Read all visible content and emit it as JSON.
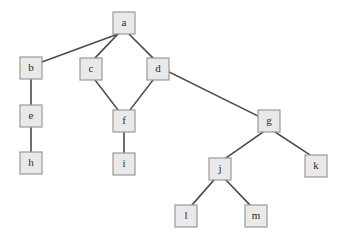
{
  "diagram": {
    "background_color": "#ffffff",
    "node_fill_color": "#e9e9e9",
    "node_border_color": "#9a9a9a",
    "edge_color": "#4a4a4a",
    "label_color": "#2b2b2b",
    "node_width": 22,
    "node_height": 22,
    "nodes": [
      {
        "id": "a",
        "label": "a",
        "x": 113,
        "y": 12
      },
      {
        "id": "b",
        "label": "b",
        "x": 20,
        "y": 57
      },
      {
        "id": "c",
        "label": "c",
        "x": 80,
        "y": 58
      },
      {
        "id": "d",
        "label": "d",
        "x": 147,
        "y": 58
      },
      {
        "id": "e",
        "label": "e",
        "x": 20,
        "y": 105
      },
      {
        "id": "f",
        "label": "f",
        "x": 113,
        "y": 110
      },
      {
        "id": "g",
        "label": "g",
        "x": 258,
        "y": 110
      },
      {
        "id": "h",
        "label": "h",
        "x": 20,
        "y": 152
      },
      {
        "id": "i",
        "label": "i",
        "x": 113,
        "y": 153
      },
      {
        "id": "j",
        "label": "j",
        "x": 209,
        "y": 158
      },
      {
        "id": "k",
        "label": "k",
        "x": 305,
        "y": 155
      },
      {
        "id": "l",
        "label": "l",
        "x": 175,
        "y": 205
      },
      {
        "id": "m",
        "label": "m",
        "x": 245,
        "y": 205
      }
    ],
    "edges": [
      {
        "from": "a",
        "to": "b",
        "x1": 118,
        "y1": 34,
        "x2": 42,
        "y2": 62
      },
      {
        "from": "a",
        "to": "c",
        "x1": 118,
        "y1": 34,
        "x2": 95,
        "y2": 58
      },
      {
        "from": "a",
        "to": "d",
        "x1": 129,
        "y1": 34,
        "x2": 153,
        "y2": 58
      },
      {
        "from": "b",
        "to": "e",
        "x1": 31,
        "y1": 79,
        "x2": 31,
        "y2": 105
      },
      {
        "from": "e",
        "to": "h",
        "x1": 31,
        "y1": 127,
        "x2": 31,
        "y2": 152
      },
      {
        "from": "c",
        "to": "f",
        "x1": 95,
        "y1": 80,
        "x2": 118,
        "y2": 110
      },
      {
        "from": "d",
        "to": "f",
        "x1": 153,
        "y1": 80,
        "x2": 130,
        "y2": 110
      },
      {
        "from": "f",
        "to": "i",
        "x1": 124,
        "y1": 132,
        "x2": 124,
        "y2": 153
      },
      {
        "from": "d",
        "to": "g",
        "x1": 169,
        "y1": 72,
        "x2": 258,
        "y2": 116
      },
      {
        "from": "g",
        "to": "j",
        "x1": 263,
        "y1": 132,
        "x2": 226,
        "y2": 158
      },
      {
        "from": "g",
        "to": "k",
        "x1": 275,
        "y1": 132,
        "x2": 310,
        "y2": 155
      },
      {
        "from": "j",
        "to": "l",
        "x1": 214,
        "y1": 180,
        "x2": 192,
        "y2": 205
      },
      {
        "from": "j",
        "to": "m",
        "x1": 226,
        "y1": 180,
        "x2": 250,
        "y2": 205
      }
    ]
  }
}
